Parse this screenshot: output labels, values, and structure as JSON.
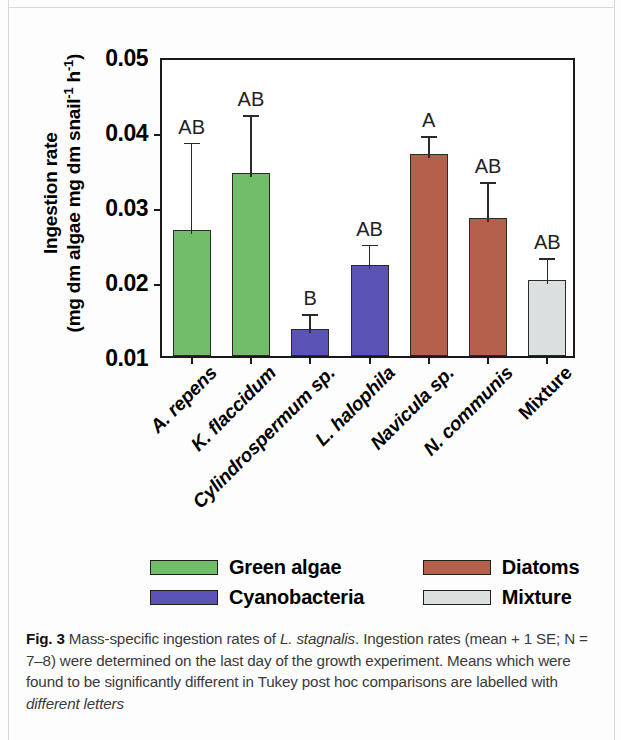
{
  "figure": {
    "number_label": "Fig. 3",
    "caption_parts": {
      "p1": " Mass-specific ingestion rates of ",
      "sp1": "L. stagnalis",
      "p2": ". Ingestion rates (mean + 1 SE; N = 7–8) were determined on the last day of the growth experiment. Means which were found to be significantly different in Tukey post hoc comparisons are labelled with ",
      "em1": "different letters"
    }
  },
  "chart_data": {
    "type": "bar",
    "title": "",
    "xlabel": "",
    "ylabel_line1": "Ingestion rate",
    "ylabel_line2_pre": "(mg dm algae mg dm snail",
    "ylabel_line2_sup1": "-1",
    "ylabel_line2_mid": "  h",
    "ylabel_line2_sup2": "-1",
    "ylabel_line2_post": ")",
    "ylim": [
      0.01,
      0.05
    ],
    "yticks": [
      "0.05",
      "0.04",
      "0.03",
      "0.02",
      "0.01"
    ],
    "ytick_values": [
      0.05,
      0.04,
      0.03,
      0.02,
      0.01
    ],
    "grid": false,
    "legend_position": "below-plot",
    "categories": [
      "A. repens",
      "K. flaccidum",
      "Cylindrospermum sp.",
      "L. halophila",
      "Navicula sp.",
      "N. communis",
      "Mixture"
    ],
    "values": [
      0.0268,
      0.0344,
      0.0136,
      0.0221,
      0.0369,
      0.0284,
      0.0201
    ],
    "errors_upper": [
      0.0122,
      0.0083,
      0.0025,
      0.0033,
      0.003,
      0.0053,
      0.0035
    ],
    "error_tops": [
      0.039,
      0.0427,
      0.0161,
      0.0254,
      0.0399,
      0.0337,
      0.0236
    ],
    "significance_letters": [
      "AB",
      "AB",
      "B",
      "AB",
      "A",
      "AB",
      "AB"
    ],
    "bar_group": [
      "Green algae",
      "Green algae",
      "Cyanobacteria",
      "Cyanobacteria",
      "Diatoms",
      "Diatoms",
      "Mixture"
    ],
    "colors": {
      "green_algae": "#72bd6a",
      "cyanobacteria": "#5b53b5",
      "diatoms": "#b4604d",
      "mixture": "#dcdfe0",
      "axis": "#1a1a1a"
    },
    "bar_colors": [
      "#72bd6a",
      "#72bd6a",
      "#5b53b5",
      "#5b53b5",
      "#b4604d",
      "#b4604d",
      "#dcdfe0"
    ],
    "legend": [
      {
        "label": "Green algae",
        "color": "#72bd6a"
      },
      {
        "label": "Diatoms",
        "color": "#b4604d"
      },
      {
        "label": "Cyanobacteria",
        "color": "#5b53b5"
      },
      {
        "label": "Mixture",
        "color": "#dcdfe0"
      }
    ]
  }
}
